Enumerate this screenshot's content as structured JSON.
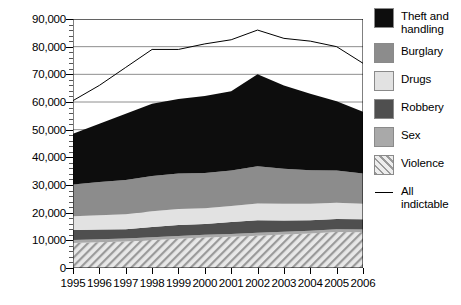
{
  "chart_data": {
    "type": "area",
    "stacked": true,
    "title": "",
    "xlabel": "",
    "ylabel": "",
    "ylim": [
      0,
      90000
    ],
    "ytick_labels": [
      "0",
      "10,000",
      "20,000",
      "30,000",
      "40,000",
      "50,000",
      "60,000",
      "70,000",
      "80,000",
      "90,000"
    ],
    "ytick_values": [
      0,
      10000,
      20000,
      30000,
      40000,
      50000,
      60000,
      70000,
      80000,
      90000
    ],
    "grid": true,
    "grid_axis": "y",
    "legend_position": "right",
    "categories": [
      "1995",
      "1996",
      "1997",
      "1998",
      "1999",
      "2000",
      "2001",
      "2002",
      "2003",
      "2004",
      "2005",
      "2006"
    ],
    "x": [
      1995,
      1996,
      1997,
      1998,
      1999,
      2000,
      2001,
      2002,
      2003,
      2004,
      2005,
      2006
    ],
    "stack_order_bottom_to_top": [
      "Violence",
      "Sex",
      "Robbery",
      "Drugs",
      "Burglary",
      "Theft and handling"
    ],
    "series": [
      {
        "name": "Violence",
        "color": "#cfcfcf",
        "pattern": "diagonal-hatch",
        "values": [
          9000,
          9300,
          9600,
          10100,
          10600,
          11000,
          11300,
          11700,
          12100,
          12500,
          13000,
          12900
        ]
      },
      {
        "name": "Sex",
        "color": "#a9a9a9",
        "pattern": "solid",
        "values": [
          1100,
          1100,
          1050,
          1050,
          1000,
          1000,
          1000,
          1000,
          1000,
          1000,
          1000,
          1000
        ]
      },
      {
        "name": "Robbery",
        "color": "#4f4f4f",
        "pattern": "solid",
        "values": [
          3600,
          3500,
          3400,
          3700,
          3900,
          3900,
          4300,
          4600,
          4100,
          3800,
          3700,
          3700
        ]
      },
      {
        "name": "Drugs",
        "color": "#e2e2e2",
        "pattern": "solid",
        "values": [
          5000,
          5200,
          5400,
          5700,
          5800,
          5700,
          5800,
          6000,
          6000,
          5900,
          5900,
          5600
        ]
      },
      {
        "name": "Burglary",
        "color": "#8c8c8c",
        "pattern": "solid",
        "values": [
          11500,
          12000,
          12400,
          12700,
          12900,
          12700,
          12800,
          13500,
          12700,
          12100,
          11600,
          11000
        ]
      },
      {
        "name": "Theft and handling",
        "color": "#0d0d0d",
        "pattern": "solid",
        "values": [
          18300,
          21000,
          23900,
          26100,
          26900,
          27900,
          28700,
          33200,
          30100,
          27700,
          25100,
          22300
        ]
      }
    ],
    "line_series": {
      "name": "All indictable",
      "color": "#000000",
      "values": [
        60500,
        66000,
        72500,
        79000,
        79000,
        81000,
        82500,
        86000,
        83000,
        82000,
        80000,
        74000
      ]
    },
    "stack_totals": [
      48500,
      52100,
      55750,
      59350,
      61100,
      62200,
      63900,
      70000,
      66000,
      63000,
      60300,
      56500
    ]
  },
  "legend": {
    "items": [
      {
        "label": "Theft and\nhandling",
        "label_line1": "Theft and",
        "label_line2": "handling",
        "swatch": "#0d0d0d",
        "type": "swatch"
      },
      {
        "label": "Burglary",
        "label_line1": "Burglary",
        "label_line2": "",
        "swatch": "#8c8c8c",
        "type": "swatch"
      },
      {
        "label": "Drugs",
        "label_line1": "Drugs",
        "label_line2": "",
        "swatch": "#e2e2e2",
        "type": "swatch"
      },
      {
        "label": "Robbery",
        "label_line1": "Robbery",
        "label_line2": "",
        "swatch": "#4f4f4f",
        "type": "swatch"
      },
      {
        "label": "Sex",
        "label_line1": "Sex",
        "label_line2": "",
        "swatch": "#a9a9a9",
        "type": "swatch"
      },
      {
        "label": "Violence",
        "label_line1": "Violence",
        "label_line2": "",
        "swatch": "#cfcfcf",
        "type": "hatch-swatch"
      },
      {
        "label": "All\nindictable",
        "label_line1": "All",
        "label_line2": "indictable",
        "swatch": "#000000",
        "type": "line"
      }
    ]
  },
  "colors": {
    "axis": "#000000",
    "gridline": "#8e8e8e",
    "background": "#ffffff"
  }
}
